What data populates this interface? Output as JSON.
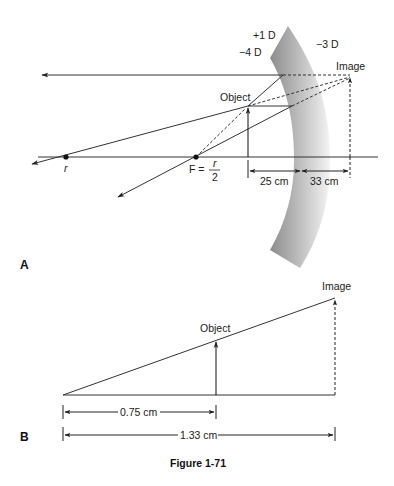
{
  "panel_a": {
    "label": "A",
    "lens_powers": {
      "front_plus": "+1 D",
      "front_minus": "−4 D",
      "back": "−3 D"
    },
    "object_label": "Object",
    "image_label": "Image",
    "r_label": "r",
    "focal_label_prefix": "F =",
    "focal_numerator": "r",
    "focal_denominator": "2",
    "dist_object": "25 cm",
    "dist_image": "33 cm"
  },
  "panel_b": {
    "label": "B",
    "object_label": "Object",
    "image_label": "Image",
    "dist_object": "0.75 cm",
    "dist_image": "1.33 cm"
  },
  "caption": "Figure 1-71",
  "colors": {
    "line": "#333333",
    "lens_dark": "#8a8a8a",
    "lens_light": "#f2f2f2"
  }
}
